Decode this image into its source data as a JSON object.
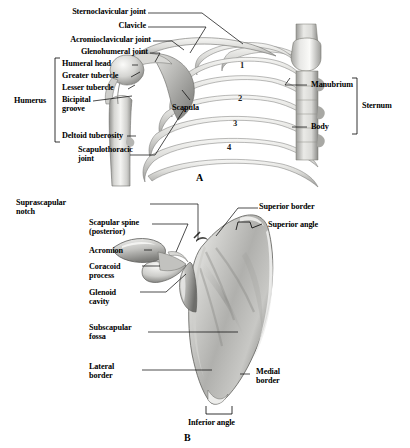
{
  "figure": {
    "background_color": "#ffffff",
    "ink_color": "#000000",
    "bone_light": "#f2f2f0",
    "bone_mid": "#c9c9c6",
    "bone_dark": "#9a9a97",
    "bone_shadow": "#6f6f6d"
  },
  "panels": [
    {
      "letter": "A",
      "caption_x": 196,
      "caption_y": 172
    },
    {
      "letter": "B",
      "caption_x": 184,
      "caption_y": 432
    }
  ],
  "panel_a": {
    "letter": "A",
    "left_labels": [
      {
        "text": "Sternoclavicular joint",
        "x": 66,
        "y": 10
      },
      {
        "text": "Clavicle",
        "x": 122,
        "y": 24
      },
      {
        "text": "Acromioclavicular joint",
        "x": 58,
        "y": 38
      },
      {
        "text": "Glenohumeral joint",
        "x": 62,
        "y": 50
      },
      {
        "text": "Humeral head",
        "x": 60,
        "y": 62
      },
      {
        "text": "Greater tubercle",
        "x": 60,
        "y": 74
      },
      {
        "text": "Lesser tubercle",
        "x": 60,
        "y": 86
      },
      {
        "text": "Bicipital\ngroove",
        "x": 60,
        "y": 98
      },
      {
        "text": "Deltoid tuberosity",
        "x": 60,
        "y": 133
      },
      {
        "text": "Scapulothoracic\njoint",
        "x": 78,
        "y": 147
      }
    ],
    "bracket_labels": [
      {
        "text": "Humerus",
        "x": 18,
        "y": 98,
        "side": "left"
      },
      {
        "text": "Sternum",
        "x": 368,
        "y": 104,
        "side": "right"
      }
    ],
    "inline_labels": [
      {
        "text": "Scapula",
        "x": 173,
        "y": 106
      }
    ],
    "right_labels": [
      {
        "text": "Manubrium",
        "x": 310,
        "y": 82
      },
      {
        "text": "Body",
        "x": 310,
        "y": 124
      }
    ],
    "rib_numbers": [
      {
        "text": "1",
        "x": 240,
        "y": 66
      },
      {
        "text": "2",
        "x": 238,
        "y": 99
      },
      {
        "text": "3",
        "x": 234,
        "y": 124
      },
      {
        "text": "4",
        "x": 228,
        "y": 148
      }
    ]
  },
  "panel_b": {
    "letter": "B",
    "left_labels": [
      {
        "text": "Suprascapular\nnotch",
        "x": 89,
        "y": 196
      },
      {
        "text": "Scapular spine\n(posterior)",
        "x": 89,
        "y": 222
      },
      {
        "text": "Acromion",
        "x": 89,
        "y": 250
      },
      {
        "text": "Coracoid\nprocess",
        "x": 89,
        "y": 266
      },
      {
        "text": "Glenoid\ncavity",
        "x": 89,
        "y": 292
      },
      {
        "text": "Subscapular\nfossa",
        "x": 89,
        "y": 327
      },
      {
        "text": "Lateral\nborder",
        "x": 89,
        "y": 366
      }
    ],
    "right_labels": [
      {
        "text": "Superior border",
        "x": 258,
        "y": 205
      },
      {
        "text": "Superior angle",
        "x": 268,
        "y": 223
      },
      {
        "text": "Medial\nborder",
        "x": 258,
        "y": 369
      }
    ],
    "bottom_labels": [
      {
        "text": "Inferior angle",
        "x": 192,
        "y": 420
      }
    ]
  }
}
